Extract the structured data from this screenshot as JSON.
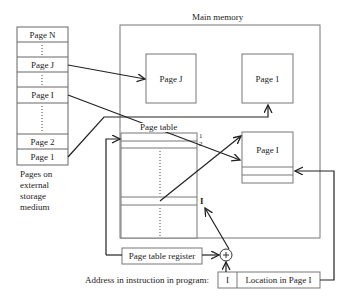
{
  "external_storage": {
    "caption": [
      "Pages on",
      "external",
      "storage",
      "medium"
    ],
    "pages": [
      {
        "label": "Page N"
      },
      {
        "label": ":"
      },
      {
        "label": "Page J"
      },
      {
        "label": ":"
      },
      {
        "label": "Page I"
      },
      {
        "label": ":"
      },
      {
        "label": "Page 2"
      },
      {
        "label": "Page 1"
      }
    ]
  },
  "main_memory": {
    "title": "Main memory",
    "frames": {
      "page_j": "Page J",
      "page_1": "Page 1",
      "page_i": "Page I"
    }
  },
  "page_table": {
    "title": "Page table",
    "index_labels": {
      "first": "1",
      "second": "2",
      "entry_i": "I"
    }
  },
  "page_table_register": {
    "label": "Page table register"
  },
  "adder": {
    "symbol": "+"
  },
  "address": {
    "caption": "Address in instruction in program:",
    "page_field": "I",
    "offset_field": "Location in Page I"
  }
}
